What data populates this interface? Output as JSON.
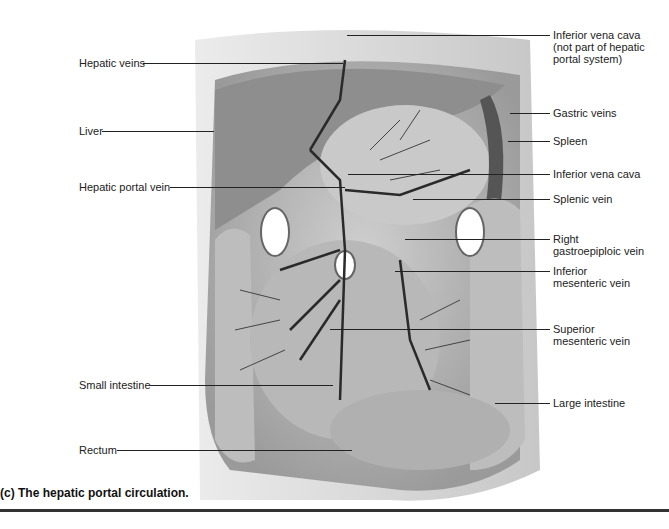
{
  "figure": {
    "caption": "(c) The hepatic portal circulation.",
    "labels_left": {
      "hepatic_veins": "Hepatic veins",
      "liver": "Liver",
      "hepatic_portal_vein": "Hepatic portal vein",
      "small_intestine": "Small intestine",
      "rectum": "Rectum"
    },
    "labels_right": {
      "ivc_top_l1": "Inferior vena cava",
      "ivc_top_l2": "(not part of hepatic",
      "ivc_top_l3": "portal system)",
      "gastric_veins": "Gastric veins",
      "spleen": "Spleen",
      "ivc": "Inferior vena cava",
      "splenic_vein": "Splenic vein",
      "right_gastro_l1": "Right",
      "right_gastro_l2": "gastroepiploic vein",
      "inf_mes_l1": "Inferior",
      "inf_mes_l2": "mesenteric vein",
      "sup_mes_l1": "Superior",
      "sup_mes_l2": "mesenteric vein",
      "large_intestine": "Large intestine"
    }
  }
}
